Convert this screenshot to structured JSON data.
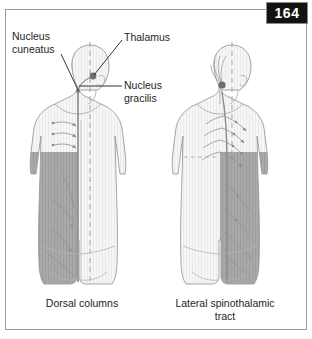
{
  "page": {
    "number": "164",
    "background_color": "#ffffff",
    "frame_color": "#9a9a9a",
    "badge_color": "#121212"
  },
  "figure_type": "medical-illustration",
  "illustration": {
    "topic": "Sensory pathway lesions — dorsal columns vs lateral spinothalamic tract",
    "view": "posterior torso and head",
    "shade_color": "#a8a8a8",
    "body_color": "#f4f4f4",
    "outline_color": "#9b9b9b",
    "nucleus_dot_color": "#6f6f6f"
  },
  "labels": [
    {
      "id": "nucleus-cuneatus",
      "text": "Nucleus\ncuneatus"
    },
    {
      "id": "thalamus",
      "text": "Thalamus"
    },
    {
      "id": "nucleus-gracilis",
      "text": "Nucleus\ngracilis"
    }
  ],
  "captions": [
    {
      "id": "dorsal-columns",
      "text": "Dorsal columns"
    },
    {
      "id": "lateral-spinothalamic-tract",
      "text": "Lateral spinothalamic\ntract"
    }
  ],
  "panels": [
    {
      "id": "left-panel",
      "caption": "Dorsal columns",
      "shaded_side": "ipsilateral-left",
      "nerve_arrow_count": 3
    },
    {
      "id": "right-panel",
      "caption": "Lateral spinothalamic tract",
      "shaded_side": "contralateral-right",
      "nerve_arrow_count": 4
    }
  ]
}
